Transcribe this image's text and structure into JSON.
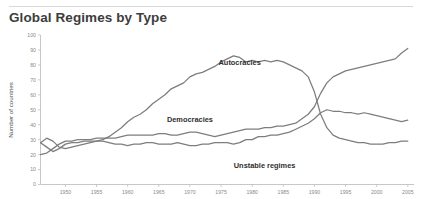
{
  "header": {
    "title": "Global Regimes by Type"
  },
  "chart_data": {
    "type": "line",
    "title": "Global Regimes by Type",
    "xlabel": "",
    "ylabel": "Number of countries",
    "xlim": [
      1946,
      2006
    ],
    "ylim": [
      0,
      100
    ],
    "ytick_values": [
      0,
      10,
      20,
      30,
      40,
      50,
      60,
      70,
      80,
      90,
      100
    ],
    "ytick_labels": [
      "0",
      "10",
      "20",
      "30",
      "40",
      "50",
      "60",
      "70",
      "80",
      "90",
      "100"
    ],
    "xtick_values": [
      1950,
      1955,
      1960,
      1965,
      1970,
      1975,
      1980,
      1985,
      1990,
      1995,
      2000,
      2005
    ],
    "xtick_labels": [
      "1950",
      "1955",
      "1960",
      "1965",
      "1970",
      "1975",
      "1980",
      "1985",
      "1990",
      "1995",
      "2000",
      "2005"
    ],
    "grid": false,
    "legend_position": "inline-annotations",
    "line_color": "#7d7d7d",
    "x": [
      1946,
      1947,
      1948,
      1949,
      1950,
      1951,
      1952,
      1953,
      1954,
      1955,
      1956,
      1957,
      1958,
      1959,
      1960,
      1961,
      1962,
      1963,
      1964,
      1965,
      1966,
      1967,
      1968,
      1969,
      1970,
      1971,
      1972,
      1973,
      1974,
      1975,
      1976,
      1977,
      1978,
      1979,
      1980,
      1981,
      1982,
      1983,
      1984,
      1985,
      1986,
      1987,
      1988,
      1989,
      1990,
      1991,
      1992,
      1993,
      1994,
      1995,
      1996,
      1997,
      1998,
      1999,
      2000,
      2001,
      2002,
      2003,
      2004,
      2005
    ],
    "series": [
      {
        "name": "Autocracies",
        "label": "Autocracies",
        "values": [
          28,
          31,
          29,
          25,
          24,
          25,
          26,
          27,
          28,
          29,
          30,
          32,
          35,
          38,
          42,
          45,
          47,
          50,
          54,
          57,
          60,
          64,
          66,
          68,
          72,
          74,
          75,
          77,
          79,
          82,
          84,
          86,
          85,
          82,
          83,
          82,
          83,
          82,
          83,
          82,
          80,
          78,
          76,
          72,
          62,
          47,
          38,
          33,
          31,
          30,
          29,
          28,
          28,
          27,
          27,
          27,
          28,
          28,
          29,
          29
        ]
      },
      {
        "name": "Democracies",
        "label": "Democracies",
        "values": [
          20,
          21,
          24,
          27,
          29,
          29,
          30,
          30,
          30,
          31,
          31,
          31,
          31,
          32,
          33,
          33,
          33,
          33,
          33,
          34,
          34,
          33,
          33,
          34,
          35,
          35,
          34,
          33,
          32,
          33,
          34,
          35,
          36,
          37,
          37,
          37,
          38,
          38,
          39,
          39,
          40,
          41,
          44,
          47,
          52,
          61,
          68,
          72,
          74,
          76,
          77,
          78,
          79,
          80,
          81,
          82,
          83,
          84,
          88,
          91
        ]
      },
      {
        "name": "Unstable regimes",
        "label": "Unstable regimes",
        "values": [
          28,
          25,
          22,
          24,
          27,
          28,
          28,
          29,
          29,
          29,
          29,
          28,
          27,
          27,
          26,
          27,
          27,
          28,
          28,
          27,
          27,
          27,
          28,
          27,
          26,
          26,
          27,
          27,
          28,
          28,
          28,
          27,
          28,
          30,
          30,
          32,
          32,
          33,
          33,
          34,
          35,
          37,
          39,
          41,
          44,
          48,
          50,
          49,
          49,
          48,
          48,
          47,
          48,
          47,
          46,
          45,
          44,
          43,
          42,
          43
        ]
      }
    ],
    "annotations": [
      {
        "text": "Autocracies",
        "x": 1978,
        "y": 80
      },
      {
        "text": "Democracies",
        "x": 1970,
        "y": 42
      },
      {
        "text": "Unstable regimes",
        "x": 1982,
        "y": 11
      }
    ]
  }
}
